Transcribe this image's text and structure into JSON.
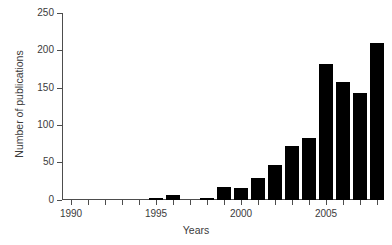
{
  "chart_data": {
    "type": "bar",
    "title": "",
    "xlabel": "Years",
    "ylabel": "Number of publications",
    "categories": [
      "1990",
      "1991",
      "1992",
      "1993",
      "1994",
      "1995",
      "1996",
      "1997",
      "1998",
      "1999",
      "2000",
      "2001",
      "2002",
      "2003",
      "2004",
      "2005",
      "2006",
      "2007",
      "2008"
    ],
    "values": [
      0,
      0,
      0,
      0,
      0,
      2,
      6,
      0,
      2,
      17,
      16,
      29,
      46,
      72,
      83,
      181,
      158,
      143,
      210
    ],
    "ylim": [
      0,
      250
    ],
    "yticks": [
      0,
      50,
      100,
      150,
      200,
      250
    ],
    "ytick_labels": [
      "0",
      "50",
      "100",
      "150",
      "200",
      "250"
    ],
    "xtick_values": [
      1990,
      1995,
      2000,
      2005
    ],
    "xtick_labels": [
      "1990",
      "1995",
      "2000",
      "2005"
    ],
    "grid": false,
    "legend": false,
    "bar_color": "#000000",
    "axis_color": "#4d4d4d",
    "text_color": "#3b3b3b",
    "background_color": "#ffffff"
  }
}
